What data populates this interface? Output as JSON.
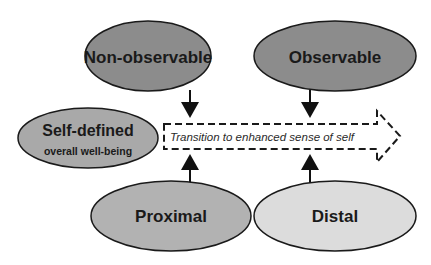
{
  "diagram": {
    "nodes": {
      "non_observable": {
        "label": "Non-observable",
        "fill": "#8c8c8c"
      },
      "observable": {
        "label": "Observable",
        "fill": "#8c8c8c"
      },
      "self_defined": {
        "label": "Self-defined",
        "sublabel": "overall well-being",
        "fill": "#a9a9a9"
      },
      "proximal": {
        "label": "Proximal",
        "fill": "#b2b2b2"
      },
      "distal": {
        "label": "Distal",
        "fill": "#dcdcdc"
      }
    },
    "transition": {
      "label": "Transition to enhanced sense of self"
    },
    "edges": [
      {
        "from": "Non-observable",
        "to": "Transition"
      },
      {
        "from": "Observable",
        "to": "Transition"
      },
      {
        "from": "Proximal",
        "to": "Transition"
      },
      {
        "from": "Distal",
        "to": "Transition"
      }
    ],
    "stroke_color": "#1a1a1a"
  }
}
